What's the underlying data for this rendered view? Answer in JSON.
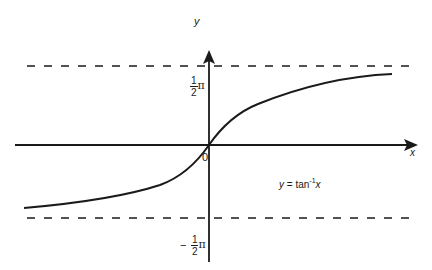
{
  "diagram": {
    "equation_label": {
      "lhs": "y",
      "eq": " = tan",
      "sup": "-1",
      "arg": "x"
    },
    "axes": {
      "x_label": "x",
      "y_label": "y",
      "origin_label": "0"
    },
    "asymptotes": {
      "upper": {
        "num": "1",
        "den": "2",
        "sym": "π",
        "sign": ""
      },
      "lower": {
        "num": "1",
        "den": "2",
        "sym": "π",
        "sign": "−"
      }
    },
    "colors": {
      "line": "#1a1a1a",
      "background": "#ffffff"
    }
  }
}
